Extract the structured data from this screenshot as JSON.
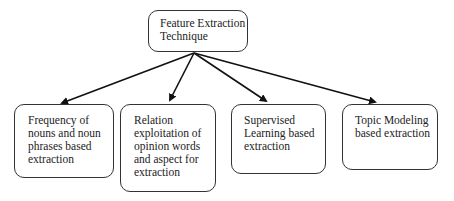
{
  "root": {
    "label": "Feature Extraction\nTechnique"
  },
  "children": [
    {
      "label": "Frequency of\nnouns and noun\nphrases based\nextraction"
    },
    {
      "label": "Relation\nexploitation of\nopinion words\nand aspect for\nextraction"
    },
    {
      "label": "Supervised\nLearning based\nextraction"
    },
    {
      "label": "Topic Modeling\nbased extraction"
    }
  ]
}
